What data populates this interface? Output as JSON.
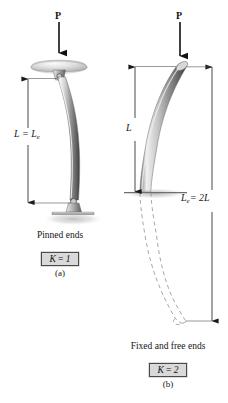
{
  "figure": {
    "background_color": "#ffffff",
    "width": 228,
    "height": 403
  },
  "panels": [
    {
      "id": "a",
      "load_label": "P",
      "length_label_main": "L = L",
      "length_label_sub": "e",
      "support_caption": "Pinned ends",
      "k_prefix": "K",
      "k_equals": " = ",
      "k_value": "1",
      "panel_label": "(a)"
    },
    {
      "id": "b",
      "load_label": "P",
      "length_label_main": "L",
      "effective_label_main": "= 2L",
      "effective_label_sub": "e",
      "effective_label_prefix": "L",
      "support_caption": "Fixed and free ends",
      "k_prefix": "K",
      "k_equals": " = ",
      "k_value": "2",
      "panel_label": "(b)"
    }
  ],
  "colors": {
    "column_light": "#f2f2f2",
    "column_mid": "#b9b9b9",
    "column_dark": "#4a4a4a",
    "ground": "#9a9a9a",
    "line": "#2b2b2b",
    "box_fill": "#d9d9d9",
    "box_border": "#4a4a4a"
  }
}
